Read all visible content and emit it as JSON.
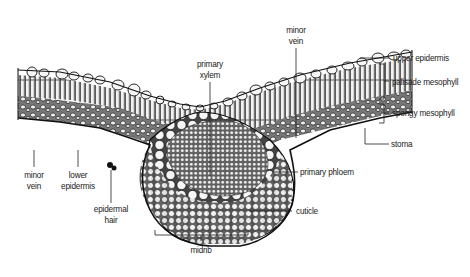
{
  "diagram": {
    "type": "leaf-cross-section",
    "labels": {
      "primary_xylem": "primary\nxylem",
      "minor_vein_top": "minor\nvein",
      "upper_epidermis": "upper epidermis",
      "palisade_mesophyll": "palisade mesophyll",
      "spongy_mesophyll": "spongy mesophyll",
      "stoma": "stoma",
      "primary_phloem": "primary phloem",
      "cuticle": "cuticle",
      "midrib": "midrib",
      "epidermal_hair": "epidermal\nhair",
      "lower_epidermis": "lower\nepidermis",
      "minor_vein_bottom": "minor\nvein"
    },
    "colors": {
      "ink": "#1a1a1a",
      "cell_fill": "#f4f4f4",
      "background": "#ffffff",
      "label_text": "#222222"
    }
  }
}
